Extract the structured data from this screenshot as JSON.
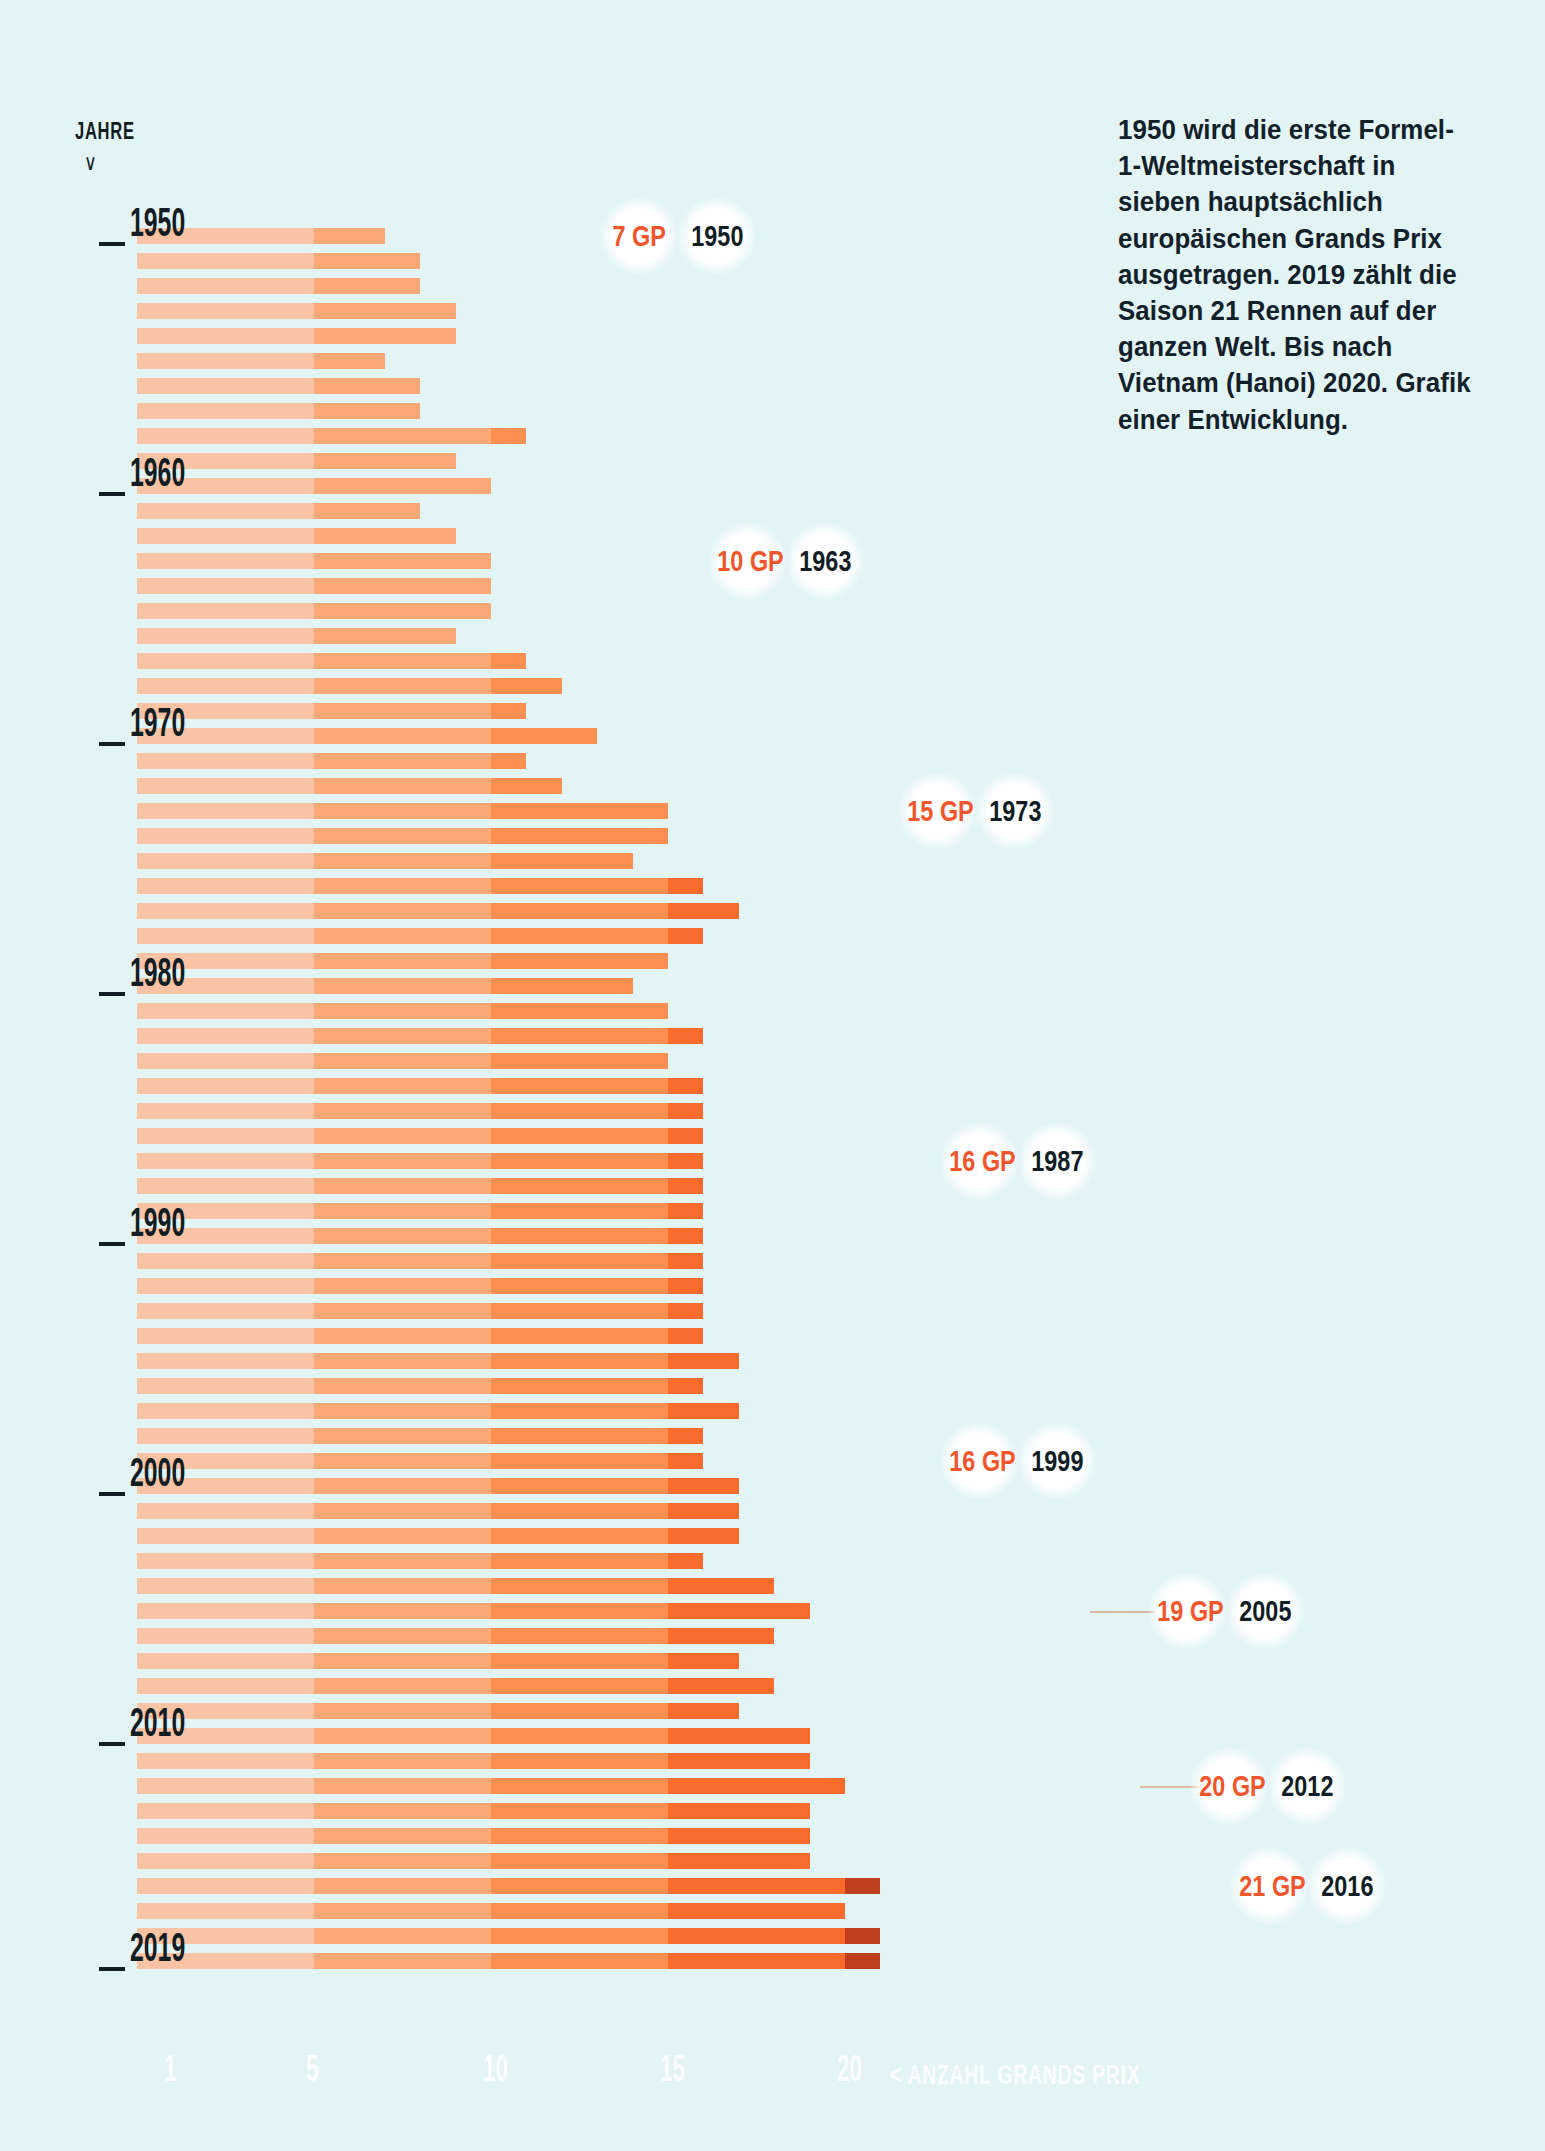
{
  "axis": {
    "y_caption": "JAHRE",
    "y_caption_arrow": "∨",
    "x_title": "< ANZAHL GRANDS PRIX",
    "x_ticks": [
      "1",
      "5",
      "10",
      "15",
      "20"
    ],
    "x_tick_values": [
      1,
      5,
      10,
      15,
      20
    ],
    "y_labels": [
      "1950",
      "1960",
      "1970",
      "1980",
      "1990",
      "2000",
      "2010",
      "2019"
    ]
  },
  "intro": {
    "text": "1950 wird die erste Formel-1-Weltmeisterschaft in sieben hauptsächlich europäischen Grands Prix ausgetragen. 2019 zählt die Saison 21 Rennen auf der ganzen Welt. Bis nach Vietnam (Hanoi) 2020. Grafik einer Entwicklung."
  },
  "colors": {
    "background": "#e3f4f5",
    "seg1": "#f9c3a4",
    "seg2": "#fba877",
    "seg3": "#fb8f52",
    "seg4": "#f96b2c",
    "seg5": "#c0401d",
    "accent": "#f0552c",
    "ink": "#111d25"
  },
  "callouts": [
    {
      "gp": "7 GP",
      "year": "1950"
    },
    {
      "gp": "10 GP",
      "year": "1963"
    },
    {
      "gp": "15 GP",
      "year": "1973"
    },
    {
      "gp": "16 GP",
      "year": "1987"
    },
    {
      "gp": "16 GP",
      "year": "1999"
    },
    {
      "gp": "19 GP",
      "year": "2005"
    },
    {
      "gp": "20 GP",
      "year": "2012"
    },
    {
      "gp": "21 GP",
      "year": "2016"
    }
  ],
  "chart_data": {
    "type": "bar",
    "orientation": "horizontal",
    "title": "",
    "xlabel": "< ANZAHL GRANDS PRIX",
    "ylabel": "JAHRE",
    "xlim": [
      0,
      21
    ],
    "grid": false,
    "legend": "none",
    "categories": [
      "1950",
      "1951",
      "1952",
      "1953",
      "1954",
      "1955",
      "1956",
      "1957",
      "1958",
      "1959",
      "1960",
      "1961",
      "1962",
      "1963",
      "1964",
      "1965",
      "1966",
      "1967",
      "1968",
      "1969",
      "1970",
      "1971",
      "1972",
      "1973",
      "1974",
      "1975",
      "1976",
      "1977",
      "1978",
      "1979",
      "1980",
      "1981",
      "1982",
      "1983",
      "1984",
      "1985",
      "1986",
      "1987",
      "1988",
      "1989",
      "1990",
      "1991",
      "1992",
      "1993",
      "1994",
      "1995",
      "1996",
      "1997",
      "1998",
      "1999",
      "2000",
      "2001",
      "2002",
      "2003",
      "2004",
      "2005",
      "2006",
      "2007",
      "2008",
      "2009",
      "2010",
      "2011",
      "2012",
      "2013",
      "2014",
      "2015",
      "2016",
      "2017",
      "2018",
      "2019"
    ],
    "values": [
      7,
      8,
      8,
      9,
      9,
      7,
      8,
      8,
      11,
      9,
      10,
      8,
      9,
      10,
      10,
      10,
      9,
      11,
      12,
      11,
      13,
      11,
      12,
      15,
      15,
      14,
      16,
      17,
      16,
      15,
      14,
      15,
      16,
      15,
      16,
      16,
      16,
      16,
      16,
      16,
      16,
      16,
      16,
      16,
      16,
      17,
      16,
      17,
      16,
      16,
      17,
      17,
      17,
      16,
      18,
      19,
      18,
      17,
      18,
      17,
      19,
      19,
      20,
      19,
      19,
      19,
      21,
      20,
      21,
      21
    ]
  }
}
